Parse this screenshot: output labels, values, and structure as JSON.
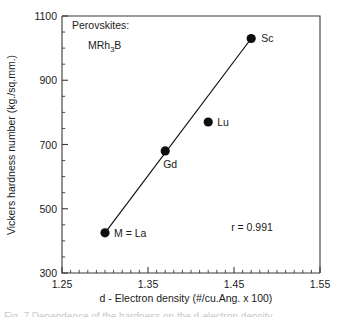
{
  "chart_data": {
    "type": "scatter",
    "title": "",
    "xlabel": "d - Electron density (#/cu.Ang. x 100)",
    "ylabel": "Vickers hardness number (kg./sq.mm.)",
    "xlim": [
      1.25,
      1.55
    ],
    "ylim": [
      300,
      1100
    ],
    "xticks": [
      "1.25",
      "1.35",
      "1.45",
      "1.55"
    ],
    "xtick_values": [
      1.25,
      1.35,
      1.45,
      1.55
    ],
    "yticks": [
      "300",
      "500",
      "700",
      "900",
      "1100"
    ],
    "ytick_values": [
      300,
      500,
      700,
      900,
      1100
    ],
    "x_minor_step": 0.01,
    "y_minor_step": 50,
    "grid": false,
    "legend": "none",
    "series": [
      {
        "name": "MRh3B perovskites",
        "points": [
          {
            "label": "M = La",
            "x": 1.3,
            "y": 425
          },
          {
            "label": "Gd",
            "x": 1.37,
            "y": 680
          },
          {
            "label": "Lu",
            "x": 1.42,
            "y": 770
          },
          {
            "label": "Sc",
            "x": 1.47,
            "y": 1030
          }
        ]
      }
    ],
    "fit_line": {
      "x1": 1.3,
      "y1": 425,
      "x2": 1.47,
      "y2": 1030
    },
    "annotations": {
      "group_title": "Perovskites:",
      "formula_prefix": "MRh",
      "formula_subscript": "3",
      "formula_suffix": "B",
      "correlation": "r = 0.991"
    }
  },
  "caption": {
    "clipped_text": "Fig. 7  Dependence of the hardness on the d-electron density"
  },
  "colors": {
    "axis": "#3a3a3a",
    "marker": "#0d0d0d",
    "line": "#111111",
    "text": "#1a1a1a",
    "background": "#ffffff"
  }
}
